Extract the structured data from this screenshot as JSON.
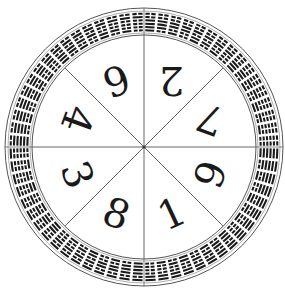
{
  "diagram": {
    "type": "circular-bagua-wheel",
    "center": [
      144,
      147
    ],
    "outer_radius": 139,
    "ring_outer_radius": 135,
    "ring_inner_radius": 115,
    "inner_radius": 112,
    "sector_count": 8,
    "hexagram_count": 64,
    "colors": {
      "line": "#555555",
      "bars": "#1a1a1a",
      "background": "#ffffff"
    },
    "sectors": [
      {
        "position": "top-right-upper",
        "digit": "2",
        "angle_deg": -67.5,
        "rotation_deg": 180
      },
      {
        "position": "right-upper",
        "digit": "7",
        "angle_deg": -22.5,
        "rotation_deg": 200
      },
      {
        "position": "right-lower",
        "digit": "9",
        "angle_deg": 22.5,
        "rotation_deg": -70
      },
      {
        "position": "bottom-right",
        "digit": "1",
        "angle_deg": 67.5,
        "rotation_deg": -25
      },
      {
        "position": "bottom-left",
        "digit": "8",
        "angle_deg": 112.5,
        "rotation_deg": 20
      },
      {
        "position": "left-lower",
        "digit": "3",
        "angle_deg": 157.5,
        "rotation_deg": 70
      },
      {
        "position": "left-upper",
        "digit": "4",
        "angle_deg": 202.5,
        "rotation_deg": 110
      },
      {
        "position": "top-left-upper",
        "digit": "6",
        "angle_deg": 247.5,
        "rotation_deg": 160
      }
    ]
  }
}
